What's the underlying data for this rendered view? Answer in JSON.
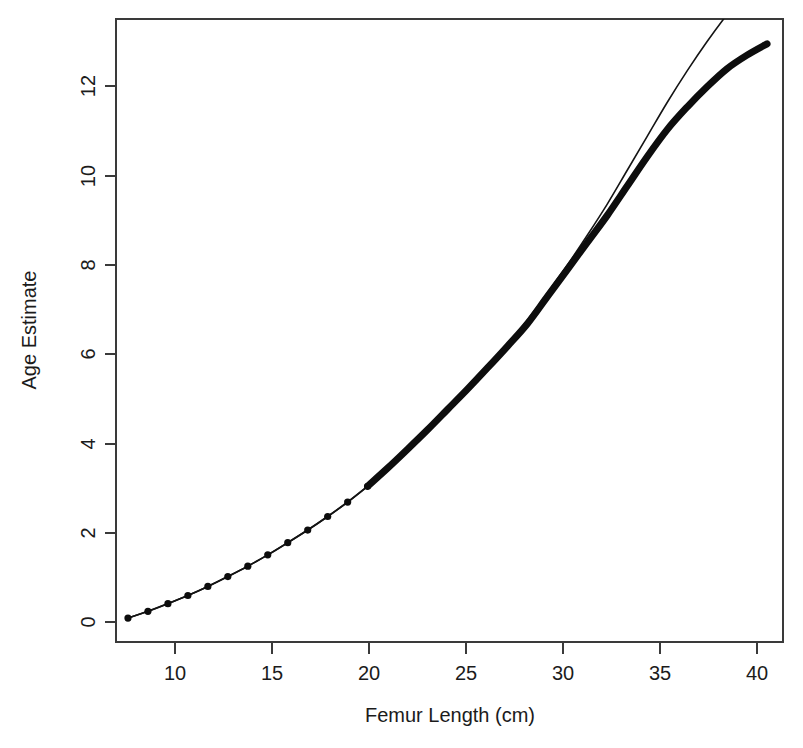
{
  "chart_data": {
    "type": "line",
    "title": "",
    "xlabel": "Femur Length (cm)",
    "ylabel": "Age Estimate",
    "xlim": [
      7.4,
      40.8
    ],
    "ylim": [
      -0.35,
      13.45
    ],
    "xticks": [
      10,
      15,
      20,
      25,
      30,
      35,
      40
    ],
    "xtick_labels": [
      "10",
      "15",
      "20",
      "25",
      "30",
      "35",
      "40"
    ],
    "yticks": [
      0,
      2,
      4,
      6,
      8,
      10,
      12
    ],
    "ytick_labels": [
      "0",
      "2",
      "4",
      "6",
      "8",
      "10",
      "12"
    ],
    "grid": false,
    "legend": "none",
    "series": [
      {
        "name": "age-estimate-marked-curve",
        "style": "thick-line-with-points",
        "markers": true,
        "x": [
          8,
          9,
          10,
          11,
          12,
          13,
          14,
          15,
          16,
          17,
          18,
          19,
          20,
          21,
          22,
          23,
          24,
          25,
          26,
          27,
          28,
          29,
          30,
          31,
          32,
          33,
          34,
          35,
          36,
          37,
          38,
          39,
          40
        ],
        "values": [
          0.18,
          0.33,
          0.5,
          0.68,
          0.88,
          1.1,
          1.33,
          1.58,
          1.85,
          2.13,
          2.43,
          2.75,
          3.1,
          3.5,
          3.92,
          4.35,
          4.8,
          5.25,
          5.72,
          6.2,
          6.7,
          7.3,
          7.9,
          8.5,
          9.1,
          9.75,
          10.4,
          11.0,
          11.5,
          11.95,
          12.35,
          12.65,
          12.9
        ]
      },
      {
        "name": "age-estimate-reference-curve",
        "style": "thin-line",
        "markers": false,
        "x": [
          8,
          9,
          10,
          11,
          12,
          13,
          14,
          15,
          16,
          17,
          18,
          19,
          20,
          21,
          22,
          23,
          24,
          25,
          26,
          27,
          28,
          29,
          30,
          31,
          32,
          33,
          34,
          35,
          36,
          37,
          38,
          39,
          40
        ],
        "values": [
          0.18,
          0.33,
          0.5,
          0.68,
          0.88,
          1.1,
          1.33,
          1.58,
          1.85,
          2.13,
          2.43,
          2.75,
          3.1,
          3.5,
          3.92,
          4.35,
          4.8,
          5.25,
          5.74,
          6.24,
          6.78,
          7.38,
          8.0,
          8.66,
          9.35,
          10.1,
          10.85,
          11.6,
          12.3,
          12.95,
          13.55,
          14.1,
          14.6
        ]
      }
    ],
    "marker_points": {
      "x": [
        8,
        9,
        10,
        11,
        12,
        13,
        14,
        15,
        16,
        17,
        18,
        19,
        20
      ],
      "values": [
        0.18,
        0.33,
        0.5,
        0.68,
        0.88,
        1.1,
        1.33,
        1.58,
        1.85,
        2.13,
        2.43,
        2.75,
        3.1
      ]
    }
  },
  "colors": {
    "curve": "#0d0d0d",
    "axis": "#3a3a3a",
    "text": "#1b1b1b",
    "background": "#ffffff"
  }
}
